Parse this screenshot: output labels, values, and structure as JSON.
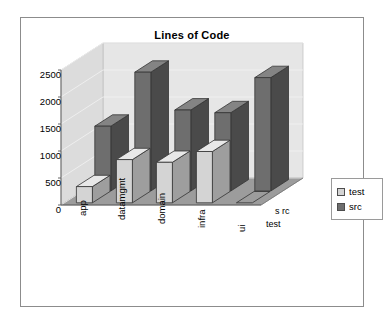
{
  "chart": {
    "title": "Lines of Code",
    "frame_border_color": "#8c8c8c",
    "background_color": "#ffffff"
  },
  "legend": {
    "position": "right",
    "entries": [
      {
        "label": "test",
        "color": "#d4d4d4"
      },
      {
        "label": "src",
        "color": "#6e6e6e"
      }
    ]
  },
  "axes": {
    "y_ticks": [
      "2500",
      "2000",
      "1500",
      "1000",
      "500",
      "0"
    ],
    "x_categories": [
      "app",
      "datamgmt",
      "domain",
      "infra",
      "ui"
    ],
    "depth_labels": [
      "s rc",
      "test"
    ]
  },
  "colors": {
    "back_wall": "#e6e6e6",
    "side_wall": "#dcdcdc",
    "floor": "#9c9c9c",
    "gridline": "#f2f2f2",
    "bar_test_front": "#d4d4d4",
    "bar_test_side": "#9e9e9e",
    "bar_test_top": "#e8e8e8",
    "bar_src_front": "#6e6e6e",
    "bar_src_side": "#4a4a4a",
    "bar_src_top": "#848484",
    "outline": "#333333"
  },
  "chart_data": {
    "type": "bar",
    "title": "Lines of Code",
    "xlabel": "",
    "ylabel": "",
    "ylim": [
      0,
      2500
    ],
    "ytick_interval": 500,
    "grid": true,
    "legend_position": "right",
    "three_d": true,
    "categories": [
      "app",
      "datamgmt",
      "domain",
      "infra",
      "ui"
    ],
    "series": [
      {
        "name": "test",
        "values": [
          300,
          800,
          750,
          950,
          0
        ]
      },
      {
        "name": "src",
        "values": [
          1200,
          2200,
          1500,
          1450,
          2100
        ]
      }
    ]
  }
}
